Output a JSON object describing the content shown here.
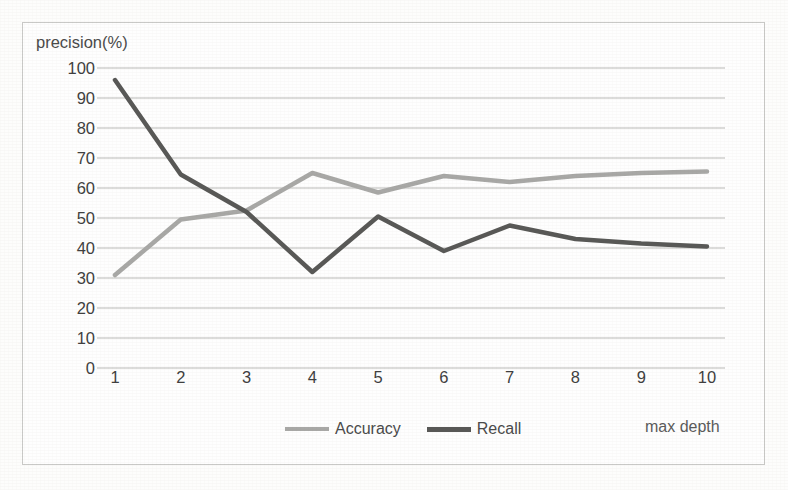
{
  "chart_data": {
    "type": "line",
    "title": "",
    "xlabel": "max depth",
    "ylabel": "precision(%)",
    "categories": [
      "1",
      "2",
      "3",
      "4",
      "5",
      "6",
      "7",
      "8",
      "9",
      "10"
    ],
    "x": [
      1,
      2,
      3,
      4,
      5,
      6,
      7,
      8,
      9,
      10
    ],
    "xlim": [
      1,
      10
    ],
    "ylim": [
      0,
      100
    ],
    "yticks": [
      "100",
      "90",
      "80",
      "70",
      "60",
      "50",
      "40",
      "30",
      "20",
      "10",
      "0"
    ],
    "ytick_values": [
      100,
      90,
      80,
      70,
      60,
      50,
      40,
      30,
      20,
      10,
      0
    ],
    "grid": true,
    "grid_axis": "y",
    "legend_position": "bottom",
    "series": [
      {
        "name": "Accuracy",
        "color": "#a8a8a6",
        "values": [
          31,
          49.5,
          52.5,
          65,
          58.5,
          64,
          62,
          64,
          65,
          65.5
        ]
      },
      {
        "name": "Recall",
        "color": "#585856",
        "values": [
          96,
          64.5,
          52,
          32,
          50.5,
          39,
          47.5,
          43,
          41.5,
          40.5
        ]
      }
    ]
  },
  "colors": {
    "accuracy": "#a8a8a6",
    "recall": "#585856",
    "grid": "#b9b9b6",
    "frame": "#c9c9c7",
    "axis_text": "#3f3f3f",
    "background": "#fefefe"
  }
}
